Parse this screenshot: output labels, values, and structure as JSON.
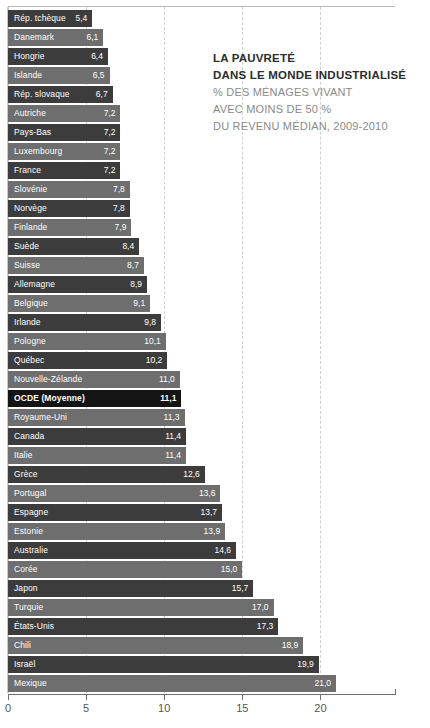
{
  "chart_data": {
    "type": "bar",
    "orientation": "horizontal",
    "title": "LA PAUVRETÉ DANS LE MONDE INDUSTRIALISÉ",
    "title_lines": [
      "LA PAUVRETÉ",
      "DANS LE MONDE INDUSTRIALISÉ"
    ],
    "subtitle_lines": [
      "% DES MÉNAGES VIVANT",
      "AVEC MOINS DE 50 %",
      "DU REVENU MÉDIAN, 2009-2010"
    ],
    "xlabel": "",
    "ylabel": "",
    "xlim": [
      0,
      24.8
    ],
    "ticks": [
      0,
      5,
      10,
      15,
      20
    ],
    "tick_labels": [
      "0",
      "5",
      "10",
      "15",
      "20"
    ],
    "grid": "vertical-dashed",
    "legend": "none",
    "decimal_separator": ",",
    "categories": [
      "Rép. tchèque",
      "Danemark",
      "Hongrie",
      "Islande",
      "Rép. slovaque",
      "Autriche",
      "Pays-Bas",
      "Luxembourg",
      "France",
      "Slovénie",
      "Norvège",
      "Finlande",
      "Suède",
      "Suisse",
      "Allemagne",
      "Belgique",
      "Irlande",
      "Pologne",
      "Québec",
      "Nouvelle-Zélande",
      "OCDE (Moyenne)",
      "Royaume-Uni",
      "Canada",
      "Italie",
      "Grèce",
      "Portugal",
      "Espagne",
      "Estonie",
      "Australie",
      "Corée",
      "Japon",
      "Turquie",
      "États-Unis",
      "Chili",
      "Israël",
      "Mexique"
    ],
    "values": [
      5.4,
      6.1,
      6.4,
      6.5,
      6.7,
      7.2,
      7.2,
      7.2,
      7.2,
      7.8,
      7.8,
      7.9,
      8.4,
      8.7,
      8.9,
      9.1,
      9.8,
      10.1,
      10.2,
      11.0,
      11.1,
      11.3,
      11.4,
      11.4,
      12.6,
      13.6,
      13.7,
      13.9,
      14.6,
      15.0,
      15.7,
      17.0,
      17.3,
      18.9,
      19.9,
      21.0
    ],
    "value_labels": [
      "5,4",
      "6,1",
      "6,4",
      "6,5",
      "6,7",
      "7,2",
      "7,2",
      "7,2",
      "7,2",
      "7,8",
      "7,8",
      "7,9",
      "8,4",
      "8,7",
      "8,9",
      "9,1",
      "9,8",
      "10,1",
      "10,2",
      "11,0",
      "11,1",
      "11,3",
      "11,4",
      "11,4",
      "12,6",
      "13,6",
      "13,7",
      "13,9",
      "14,6",
      "15,0",
      "15,7",
      "17,0",
      "17,3",
      "18,9",
      "19,9",
      "21,0"
    ],
    "highlight_category": "OCDE (Moyenne)",
    "colors": {
      "bar_dark": "#3c3c3c",
      "bar_light": "#6e6e6e",
      "bar_highlight": "#141414",
      "grid": "#cfcfcf",
      "axis": "#6f6f6f",
      "title_text": "#2c2c2c",
      "subtitle_text": "#8a8a8a",
      "bar_text": "#ffffff",
      "background": "#ffffff"
    }
  }
}
